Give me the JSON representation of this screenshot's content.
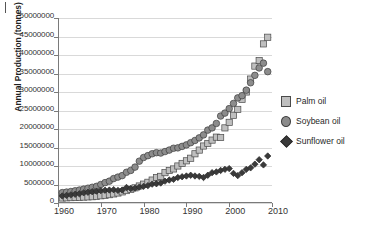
{
  "chart_data": {
    "type": "scatter",
    "title": "",
    "xlabel": "",
    "ylabel": "Annual Production (tonnes)",
    "xlim": [
      1960,
      2010
    ],
    "ylim": [
      0,
      50000000
    ],
    "grid": true,
    "legend_position": "right",
    "x_ticks": [
      "1960",
      "1970",
      "1980",
      "1990",
      "2000",
      "2010"
    ],
    "y_ticks": [
      "0",
      "5000000",
      "10000000",
      "15000000",
      "20000000",
      "25000000",
      "30000000",
      "35000000",
      "40000000",
      "45000000",
      "50000000"
    ],
    "x": [
      1961,
      1962,
      1963,
      1964,
      1965,
      1966,
      1967,
      1968,
      1969,
      1970,
      1971,
      1972,
      1973,
      1974,
      1975,
      1976,
      1977,
      1978,
      1979,
      1980,
      1981,
      1982,
      1983,
      1984,
      1985,
      1986,
      1987,
      1988,
      1989,
      1990,
      1991,
      1992,
      1993,
      1994,
      1995,
      1996,
      1997,
      1998,
      1999,
      2000,
      2001,
      2002,
      2003,
      2004,
      2005,
      2006,
      2007,
      2008,
      2009
    ],
    "series": [
      {
        "name": "Palm oil",
        "marker": "square",
        "color": "#bfbfbf",
        "edge_color": "#4a4a4a",
        "values": [
          1350000,
          1400000,
          1450000,
          1500000,
          1550000,
          1600000,
          1650000,
          1700000,
          1800000,
          1950000,
          2100000,
          2250000,
          2450000,
          2700000,
          3000000,
          3350000,
          3700000,
          4100000,
          4600000,
          5100000,
          5600000,
          6200000,
          6900000,
          7200000,
          8200000,
          8800000,
          9200000,
          10000000,
          10700000,
          11400000,
          12100000,
          13300000,
          14300000,
          15400000,
          16100000,
          17000000,
          17800000,
          17700000,
          20300000,
          21800000,
          23700000,
          25300000,
          28000000,
          30000000,
          33500000,
          37000000,
          38500000,
          43000000,
          44800000
        ]
      },
      {
        "name": "Soybean oil",
        "marker": "circle",
        "color": "#8c8c8c",
        "edge_color": "#3d3d3d",
        "values": [
          2800000,
          2950000,
          3100000,
          3300000,
          3500000,
          3750000,
          4000000,
          4250000,
          4500000,
          5000000,
          5500000,
          5900000,
          6600000,
          7000000,
          7400000,
          8300000,
          8800000,
          9700000,
          11300000,
          12300000,
          12800000,
          13300000,
          13600000,
          13500000,
          13900000,
          14300000,
          14800000,
          14900000,
          15300000,
          15700000,
          16300000,
          16900000,
          17600000,
          18400000,
          19700000,
          20300000,
          21500000,
          23500000,
          24300000,
          25500000,
          26900000,
          28400000,
          29000000,
          30500000,
          32500000,
          34500000,
          36500000,
          37800000,
          35500000
        ]
      },
      {
        "name": "Sunflower oil",
        "marker": "diamond",
        "color": "#3a3a3a",
        "edge_color": "#2a2a2a",
        "values": [
          1900000,
          2050000,
          2200000,
          2350000,
          2500000,
          2750000,
          2900000,
          3050000,
          3200000,
          3350000,
          3450000,
          3500000,
          3600000,
          3400000,
          3500000,
          4200000,
          3900000,
          4000000,
          4300000,
          4500000,
          4700000,
          5100000,
          5200000,
          5400000,
          5900000,
          6200000,
          6400000,
          6900000,
          7100000,
          7300000,
          7500000,
          7300000,
          7200000,
          6900000,
          7500000,
          8200000,
          8400000,
          8800000,
          9100000,
          9300000,
          8000000,
          7400000,
          8200000,
          9100000,
          9500000,
          10500000,
          11700000,
          10300000,
          12700000
        ]
      }
    ]
  },
  "legend": {
    "items": [
      {
        "label": "Palm oil",
        "marker": "square"
      },
      {
        "label": "Soybean oil",
        "marker": "circle"
      },
      {
        "label": "Sunflower oil",
        "marker": "diamond"
      }
    ]
  }
}
